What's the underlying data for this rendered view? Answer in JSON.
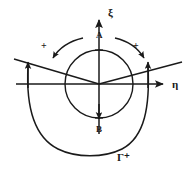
{
  "figure": {
    "background_color": "#ffffff",
    "stroke_color": "#1a1a1a",
    "axes": {
      "vertical_label": "ξ",
      "horizontal_label": "η",
      "origin": {
        "x": 99,
        "y": 84
      }
    },
    "points": [
      {
        "name": "A",
        "label": "A",
        "x": 99,
        "y": 50,
        "position": "top-of-circle"
      },
      {
        "name": "B",
        "label": "B",
        "x": 99,
        "y": 118,
        "position": "bottom-of-circle"
      }
    ],
    "circle": {
      "center_x": 99,
      "center_y": 84,
      "radius": 34
    },
    "orientation_marks": [
      {
        "name": "plus-left",
        "label": "+",
        "x": 41,
        "y": 41
      },
      {
        "name": "plus-right",
        "label": "+",
        "x": 133,
        "y": 41
      }
    ],
    "outer_contour": {
      "label": "Γ⁺",
      "label_x": 117,
      "label_y": 152,
      "left_x": 28,
      "right_x": 148,
      "bottom_y": 152,
      "arrow_direction": "upward"
    },
    "branch_line": {
      "left_end_x": 14,
      "left_end_y": 59,
      "right_end_x": 182,
      "right_end_y": 62
    }
  }
}
